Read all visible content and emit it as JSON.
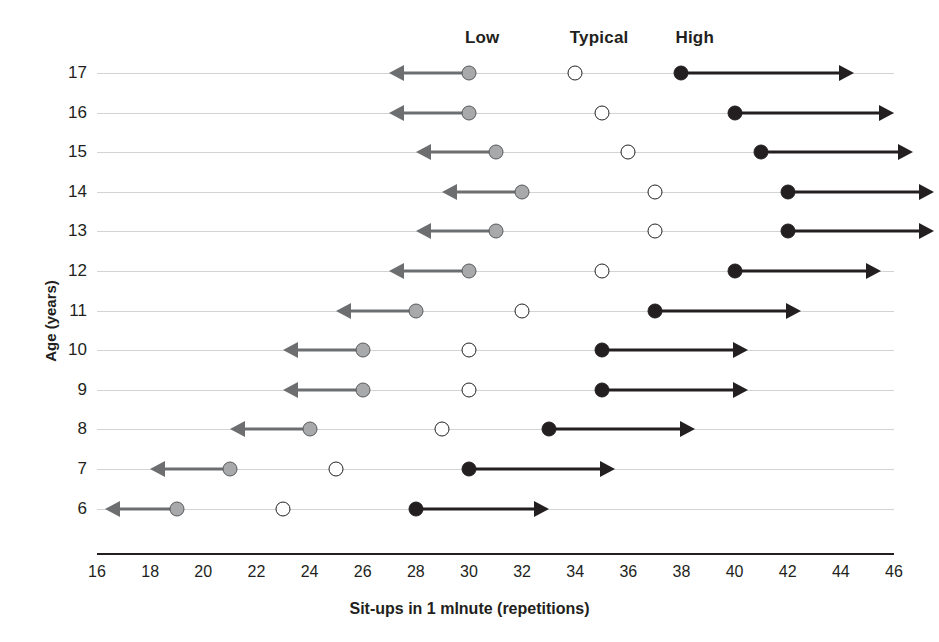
{
  "chart_data": {
    "type": "scatter",
    "title": "",
    "xlabel": "Sit-ups in 1 mlnute (repetitions)",
    "ylabel": "Age (years)",
    "xlim": [
      16,
      46
    ],
    "xticks": [
      16,
      18,
      20,
      22,
      24,
      26,
      28,
      30,
      32,
      34,
      36,
      38,
      40,
      42,
      44,
      46
    ],
    "categories": [
      17,
      16,
      15,
      14,
      13,
      12,
      11,
      10,
      9,
      8,
      7,
      6
    ],
    "grid": true,
    "legend_position": "top",
    "column_headers": [
      {
        "label": "Low",
        "value": 30.5
      },
      {
        "label": "Typical",
        "value": 34.9
      },
      {
        "label": "High",
        "value": 38.5
      }
    ],
    "series": [
      {
        "name": "Low",
        "values": [
          30,
          30,
          31,
          32,
          31,
          30,
          28,
          26,
          26,
          24,
          21,
          19
        ]
      },
      {
        "name": "Typical",
        "values": [
          34,
          35,
          36,
          37,
          37,
          35,
          32,
          30,
          30,
          29,
          25,
          23
        ]
      },
      {
        "name": "High",
        "values": [
          38,
          40,
          41,
          42,
          42,
          40,
          37,
          35,
          35,
          33,
          30,
          28
        ]
      }
    ],
    "low_arrow_ends": [
      27,
      27,
      28,
      29,
      28,
      27,
      25,
      23,
      23,
      21,
      18,
      16.3
    ],
    "high_arrow_ends": [
      44.5,
      46,
      46.7,
      47.5,
      47.5,
      45.5,
      42.5,
      40.5,
      40.5,
      38.5,
      35.5,
      33
    ],
    "rows": [
      {
        "age": "17",
        "low": 30,
        "typical": 34,
        "high": 38
      },
      {
        "age": "16",
        "low": 30,
        "typical": 35,
        "high": 40
      },
      {
        "age": "15",
        "low": 31,
        "typical": 36,
        "high": 41
      },
      {
        "age": "14",
        "low": 32,
        "typical": 37,
        "high": 42
      },
      {
        "age": "13",
        "low": 31,
        "typical": 37,
        "high": 42
      },
      {
        "age": "12",
        "low": 30,
        "typical": 35,
        "high": 40
      },
      {
        "age": "11",
        "low": 28,
        "typical": 32,
        "high": 37
      },
      {
        "age": "10",
        "low": 26,
        "typical": 30,
        "high": 35
      },
      {
        "age": "9",
        "low": 26,
        "typical": 30,
        "high": 35
      },
      {
        "age": "8",
        "low": 24,
        "typical": 29,
        "high": 33
      },
      {
        "age": "7",
        "low": 21,
        "typical": 25,
        "high": 30
      },
      {
        "age": "6",
        "low": 19,
        "typical": 23,
        "high": 28
      }
    ],
    "colors": {
      "low_marker": "#a8a9ab",
      "typical_marker": "#ffffff",
      "high_marker": "#231f20",
      "low_arrow": "#6d6e70",
      "high_arrow": "#231f20",
      "gridline": "#c9cbcd",
      "axis": "#231f20"
    }
  }
}
